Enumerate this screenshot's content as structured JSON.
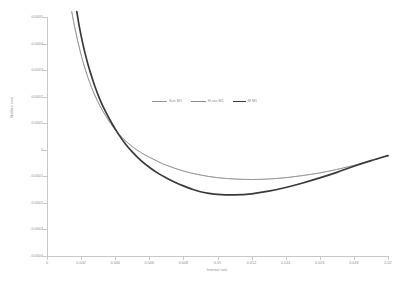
{
  "chart_data": {
    "type": "line",
    "title": "",
    "xlabel": "Interest rate",
    "ylabel": "Welfare cost",
    "xlim": [
      0,
      0.02
    ],
    "ylim": [
      -0.0004,
      0.0005
    ],
    "grid": false,
    "legend_position": "center",
    "xticks": [
      "0",
      "0.002",
      "0.004",
      "0.006",
      "0.008",
      "0.01",
      "0.012",
      "0.014",
      "0.016",
      "0.018",
      "0.02"
    ],
    "xtick_values": [
      0,
      0.002,
      0.004,
      0.006,
      0.008,
      0.01,
      0.012,
      0.014,
      0.016,
      0.018,
      0.02
    ],
    "yticks": [
      "0.0005",
      "0.0004",
      "0.0003",
      "0.0002",
      "0.0001",
      "0",
      "-0.0001",
      "-0.0002",
      "-0.0003",
      "-0.0004"
    ],
    "ytick_values": [
      0.0005,
      0.0004,
      0.0003,
      0.0002,
      0.0001,
      0,
      -0.0001,
      -0.0002,
      -0.0003,
      -0.0004
    ],
    "series": [
      {
        "name": "Sun M1",
        "color": "#969696",
        "width": 0.7,
        "x": [
          0.00145,
          0.0016,
          0.0018,
          0.002,
          0.0022,
          0.0025,
          0.0028,
          0.0031,
          0.0035,
          0.004,
          0.0045,
          0.005,
          0.0055,
          0.006,
          0.0065,
          0.007,
          0.008,
          0.009,
          0.01,
          0.011,
          0.012,
          0.013,
          0.014,
          0.015,
          0.016,
          0.017,
          0.018,
          0.019,
          0.02
        ],
        "y": [
          0.00052,
          0.00047,
          0.00041,
          0.000358,
          0.000312,
          0.000254,
          0.000206,
          0.000166,
          0.000122,
          7.6e-05,
          4e-05,
          1.2e-05,
          -1e-05,
          -2.8e-05,
          -4.4e-05,
          -5.8e-05,
          -8e-05,
          -9.5e-05,
          -0.000105,
          -0.00011,
          -0.000112,
          -0.00011,
          -0.000105,
          -9.7e-05,
          -8.7e-05,
          -7.4e-05,
          -5.9e-05,
          -4.2e-05,
          -2.2e-05
        ]
      },
      {
        "name": "H-ron M1",
        "color": "#8c8c8c",
        "width": 0.7,
        "x": [
          0.00145,
          0.0016,
          0.0018,
          0.002,
          0.0022,
          0.0025,
          0.0028,
          0.0031,
          0.0035,
          0.004,
          0.0045,
          0.005,
          0.0055,
          0.006,
          0.0065,
          0.007,
          0.008,
          0.009,
          0.01,
          0.011,
          0.012,
          0.013,
          0.014,
          0.015,
          0.016,
          0.017,
          0.018,
          0.019,
          0.02
        ],
        "y": [
          0.00052,
          0.00047,
          0.00041,
          0.000358,
          0.000312,
          0.000254,
          0.000206,
          0.000166,
          0.000122,
          7.6e-05,
          4e-05,
          1.2e-05,
          -1e-05,
          -2.8e-05,
          -4.4e-05,
          -5.8e-05,
          -8e-05,
          -9.5e-05,
          -0.000105,
          -0.00011,
          -0.000112,
          -0.00011,
          -0.000105,
          -9.7e-05,
          -8.7e-05,
          -7.4e-05,
          -5.9e-05,
          -4.2e-05,
          -2.2e-05
        ]
      },
      {
        "name": "M M1",
        "color": "#3a3a3a",
        "width": 1.7,
        "x": [
          0.00175,
          0.0019,
          0.0021,
          0.0023,
          0.0025,
          0.0028,
          0.0031,
          0.0034,
          0.0038,
          0.0042,
          0.0046,
          0.005,
          0.0055,
          0.006,
          0.0065,
          0.007,
          0.0075,
          0.008,
          0.0085,
          0.009,
          0.0095,
          0.01,
          0.011,
          0.012,
          0.013,
          0.014,
          0.015,
          0.016,
          0.017,
          0.018,
          0.019,
          0.02
        ],
        "y": [
          0.00052,
          0.000462,
          0.0004,
          0.000346,
          0.0003,
          0.00024,
          0.00019,
          0.000148,
          0.0001,
          5.8e-05,
          2.2e-05,
          -8e-06,
          -4e-05,
          -6.6e-05,
          -8.8e-05,
          -0.000106,
          -0.000122,
          -0.000136,
          -0.000148,
          -0.000158,
          -0.000164,
          -0.000168,
          -0.00017,
          -0.000166,
          -0.000156,
          -0.000142,
          -0.000125,
          -0.000106,
          -8.5e-05,
          -6.2e-05,
          -4.1e-05,
          -2.2e-05
        ]
      }
    ]
  },
  "axes": {
    "y_title": "Welfare cost",
    "x_title": "Interest rate"
  }
}
